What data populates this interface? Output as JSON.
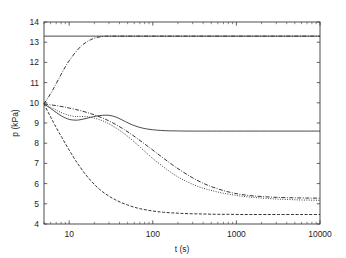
{
  "chart_data": {
    "type": "line",
    "title": "",
    "xlabel": "t (s)",
    "ylabel": "p (kPa)",
    "xscale": "log",
    "yscale": "linear",
    "xlim": [
      5,
      10000
    ],
    "ylim": [
      4,
      14
    ],
    "grid": false,
    "legend_position": "none",
    "xticks": [
      10,
      100,
      1000,
      10000
    ],
    "xtick_labels": [
      "10",
      "100",
      "1000",
      "10000"
    ],
    "yticks": [
      4,
      5,
      6,
      7,
      8,
      9,
      10,
      11,
      12,
      13,
      14
    ],
    "ytick_labels": [
      "4",
      "5",
      "6",
      "7",
      "8",
      "9",
      "10",
      "11",
      "12",
      "13",
      "14"
    ],
    "series": [
      {
        "name": "asymptote-upper",
        "style": "solid",
        "points": [
          [
            5,
            13.3
          ],
          [
            10000,
            13.3
          ]
        ]
      },
      {
        "name": "rising-curve",
        "style": "dashdot-fine",
        "points": [
          [
            5,
            9.95
          ],
          [
            6,
            10.45
          ],
          [
            7,
            10.95
          ],
          [
            8,
            11.4
          ],
          [
            9,
            11.78
          ],
          [
            10,
            12.08
          ],
          [
            12,
            12.52
          ],
          [
            14,
            12.82
          ],
          [
            16,
            13.0
          ],
          [
            18,
            13.12
          ],
          [
            20,
            13.2
          ],
          [
            23,
            13.26
          ],
          [
            26,
            13.29
          ],
          [
            30,
            13.3
          ],
          [
            40,
            13.3
          ],
          [
            60,
            13.3
          ],
          [
            100,
            13.3
          ],
          [
            1000,
            13.3
          ],
          [
            10000,
            13.3
          ]
        ]
      },
      {
        "name": "solid-plateau-curve",
        "style": "solid",
        "points": [
          [
            5,
            9.95
          ],
          [
            6,
            9.72
          ],
          [
            7,
            9.52
          ],
          [
            8,
            9.36
          ],
          [
            9,
            9.25
          ],
          [
            10,
            9.18
          ],
          [
            11,
            9.15
          ],
          [
            12,
            9.14
          ],
          [
            13,
            9.15
          ],
          [
            15,
            9.2
          ],
          [
            18,
            9.28
          ],
          [
            21,
            9.34
          ],
          [
            25,
            9.38
          ],
          [
            30,
            9.38
          ],
          [
            36,
            9.3
          ],
          [
            43,
            9.15
          ],
          [
            52,
            8.98
          ],
          [
            62,
            8.85
          ],
          [
            75,
            8.75
          ],
          [
            90,
            8.69
          ],
          [
            110,
            8.65
          ],
          [
            140,
            8.62
          ],
          [
            180,
            8.61
          ],
          [
            250,
            8.6
          ],
          [
            400,
            8.6
          ],
          [
            700,
            8.6
          ],
          [
            1500,
            8.6
          ],
          [
            4000,
            8.6
          ],
          [
            10000,
            8.6
          ]
        ]
      },
      {
        "name": "dashdot-decay-curve",
        "style": "dashdot",
        "points": [
          [
            5,
            9.95
          ],
          [
            6,
            9.9
          ],
          [
            7,
            9.86
          ],
          [
            8,
            9.82
          ],
          [
            9,
            9.78
          ],
          [
            10,
            9.74
          ],
          [
            12,
            9.67
          ],
          [
            14,
            9.6
          ],
          [
            17,
            9.5
          ],
          [
            20,
            9.4
          ],
          [
            25,
            9.25
          ],
          [
            30,
            9.1
          ],
          [
            36,
            8.93
          ],
          [
            43,
            8.74
          ],
          [
            52,
            8.52
          ],
          [
            62,
            8.3
          ],
          [
            75,
            8.05
          ],
          [
            90,
            7.8
          ],
          [
            110,
            7.53
          ],
          [
            135,
            7.25
          ],
          [
            165,
            6.98
          ],
          [
            200,
            6.74
          ],
          [
            250,
            6.48
          ],
          [
            310,
            6.25
          ],
          [
            390,
            6.04
          ],
          [
            480,
            5.88
          ],
          [
            600,
            5.74
          ],
          [
            750,
            5.62
          ],
          [
            950,
            5.52
          ],
          [
            1200,
            5.45
          ],
          [
            1600,
            5.39
          ],
          [
            2200,
            5.35
          ],
          [
            3000,
            5.32
          ],
          [
            4200,
            5.3
          ],
          [
            6000,
            5.29
          ],
          [
            8000,
            5.28
          ],
          [
            10000,
            5.28
          ]
        ]
      },
      {
        "name": "dotted-decay-curve",
        "style": "dotted",
        "points": [
          [
            5,
            9.95
          ],
          [
            6,
            9.78
          ],
          [
            7,
            9.64
          ],
          [
            8,
            9.52
          ],
          [
            9,
            9.44
          ],
          [
            10,
            9.38
          ],
          [
            11,
            9.34
          ],
          [
            12,
            9.32
          ],
          [
            13,
            9.32
          ],
          [
            15,
            9.32
          ],
          [
            17,
            9.3
          ],
          [
            20,
            9.24
          ],
          [
            24,
            9.14
          ],
          [
            28,
            9.02
          ],
          [
            33,
            8.86
          ],
          [
            40,
            8.64
          ],
          [
            48,
            8.4
          ],
          [
            58,
            8.12
          ],
          [
            70,
            7.82
          ],
          [
            85,
            7.5
          ],
          [
            100,
            7.24
          ],
          [
            120,
            6.98
          ],
          [
            145,
            6.72
          ],
          [
            175,
            6.48
          ],
          [
            210,
            6.28
          ],
          [
            255,
            6.1
          ],
          [
            310,
            5.94
          ],
          [
            380,
            5.8
          ],
          [
            460,
            5.7
          ],
          [
            560,
            5.61
          ],
          [
            700,
            5.52
          ],
          [
            880,
            5.45
          ],
          [
            1100,
            5.39
          ],
          [
            1400,
            5.34
          ],
          [
            1800,
            5.3
          ],
          [
            2400,
            5.26
          ],
          [
            3200,
            5.23
          ],
          [
            4300,
            5.21
          ],
          [
            5800,
            5.19
          ],
          [
            7800,
            5.18
          ],
          [
            10000,
            5.17
          ]
        ]
      },
      {
        "name": "dashed-fast-decay-curve",
        "style": "dashed",
        "points": [
          [
            5,
            9.95
          ],
          [
            5.5,
            9.6
          ],
          [
            6,
            9.3
          ],
          [
            6.5,
            9.02
          ],
          [
            7,
            8.78
          ],
          [
            7.5,
            8.55
          ],
          [
            8,
            8.35
          ],
          [
            9,
            7.98
          ],
          [
            10,
            7.66
          ],
          [
            11,
            7.38
          ],
          [
            12,
            7.13
          ],
          [
            13,
            6.92
          ],
          [
            15,
            6.56
          ],
          [
            17,
            6.28
          ],
          [
            20,
            5.96
          ],
          [
            23,
            5.72
          ],
          [
            27,
            5.5
          ],
          [
            31,
            5.34
          ],
          [
            36,
            5.19
          ],
          [
            42,
            5.06
          ],
          [
            50,
            4.94
          ],
          [
            60,
            4.83
          ],
          [
            72,
            4.75
          ],
          [
            88,
            4.68
          ],
          [
            110,
            4.62
          ],
          [
            135,
            4.58
          ],
          [
            170,
            4.55
          ],
          [
            210,
            4.53
          ],
          [
            270,
            4.51
          ],
          [
            350,
            4.5
          ],
          [
            450,
            4.49
          ],
          [
            600,
            4.48
          ],
          [
            800,
            4.48
          ],
          [
            1100,
            4.47
          ],
          [
            1500,
            4.47
          ],
          [
            2200,
            4.47
          ],
          [
            3200,
            4.47
          ],
          [
            5000,
            4.47
          ],
          [
            7000,
            4.47
          ],
          [
            10000,
            4.47
          ]
        ]
      }
    ],
    "annotations": []
  },
  "plot_geometry": {
    "left": 44,
    "right": 320,
    "top": 22,
    "bottom": 224
  }
}
